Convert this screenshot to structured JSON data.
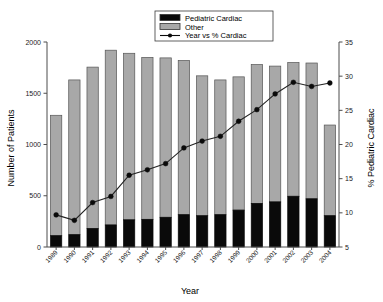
{
  "chart_data": {
    "type": "bar",
    "title": "",
    "subtitle": "",
    "xlabel": "Year",
    "ylabel": "Number of Patients",
    "y2label": "% Pediatric Cardiac",
    "grid": false,
    "legend_position": "top-center",
    "categories": [
      "1989",
      "1990",
      "1991",
      "1992",
      "1993",
      "1994",
      "1995",
      "1996",
      "1997",
      "1998",
      "1999",
      "2000",
      "2001",
      "2002",
      "2003",
      "2004"
    ],
    "ylim": [
      0,
      2000
    ],
    "yticks": [
      0,
      500,
      1000,
      1500,
      2000
    ],
    "y2lim": [
      5,
      35
    ],
    "y2ticks": [
      5,
      10,
      15,
      20,
      25,
      30,
      35
    ],
    "series": [
      {
        "name": "Pediatric Cardiac",
        "kind": "bar-stack-bottom",
        "axis": "left",
        "color": "#0a0a0a",
        "values": [
          110,
          120,
          180,
          215,
          265,
          270,
          290,
          315,
          305,
          315,
          360,
          425,
          440,
          495,
          470,
          305
        ]
      },
      {
        "name": "Other",
        "kind": "bar-stack-top",
        "axis": "left",
        "color": "#a8a8a8",
        "values": [
          1175,
          1510,
          1575,
          1705,
          1625,
          1580,
          1555,
          1505,
          1365,
          1315,
          1300,
          1355,
          1325,
          1305,
          1325,
          885
        ]
      },
      {
        "name": "Year vs % Cardiac",
        "kind": "line",
        "axis": "right",
        "color": "#0a0a0a",
        "values": [
          9.7,
          8.9,
          11.5,
          12.4,
          15.5,
          16.3,
          17.2,
          19.5,
          20.5,
          21.2,
          23.4,
          25.1,
          27.4,
          29.1,
          28.5,
          29.0
        ]
      }
    ],
    "totals": [
      1285,
      1630,
      1755,
      1920,
      1890,
      1850,
      1845,
      1820,
      1670,
      1630,
      1660,
      1780,
      1765,
      1800,
      1795,
      1190
    ],
    "legend_entries": [
      {
        "label": "Pediatric Cardiac",
        "swatch": "black-square"
      },
      {
        "label": "Other",
        "swatch": "gray-square"
      },
      {
        "label": "Year vs % Cardiac",
        "swatch": "line-marker"
      }
    ]
  },
  "colors": {
    "cardiac": "#0a0a0a",
    "other": "#a8a8a8",
    "line": "#0a0a0a",
    "axis": "#4d4d4d",
    "background": "#ffffff"
  }
}
